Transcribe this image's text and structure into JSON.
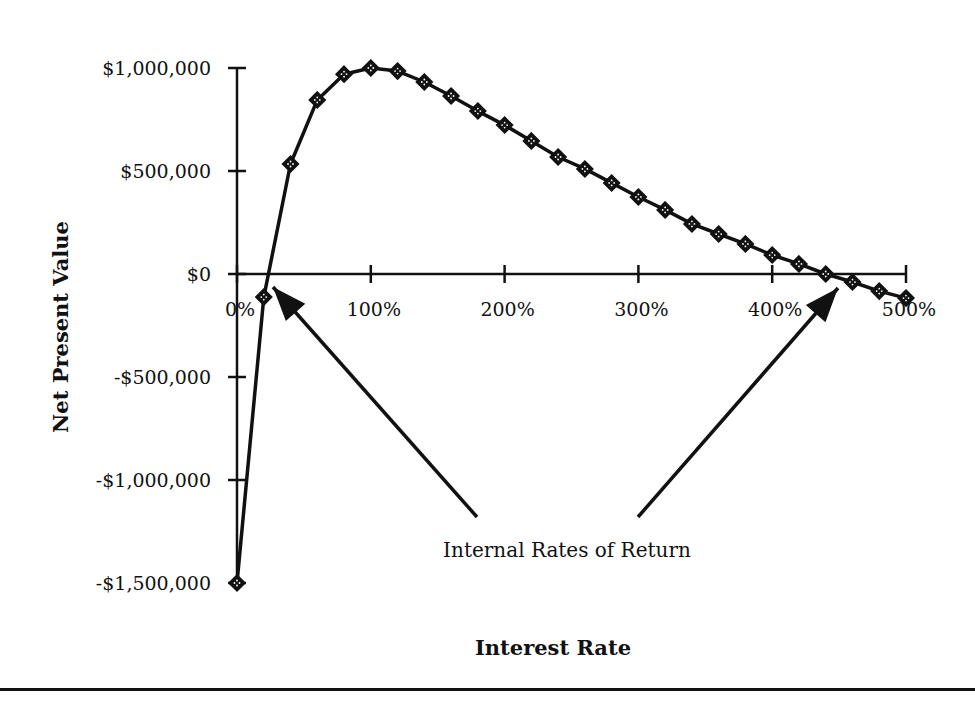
{
  "chart_data": {
    "type": "line",
    "title": "",
    "xlabel": "Interest Rate",
    "ylabel": "Net Present Value",
    "xlim": [
      0,
      500
    ],
    "ylim": [
      -1500000,
      1000000
    ],
    "x_ticks": [
      0,
      100,
      200,
      300,
      400,
      500
    ],
    "x_tick_labels": [
      "0%",
      "100%",
      "200%",
      "300%",
      "400%",
      "500%"
    ],
    "y_ticks": [
      1000000,
      500000,
      0,
      -500000,
      -1000000,
      -1500000
    ],
    "y_tick_labels": [
      "$1,000,000",
      "$500,000",
      "$0",
      "-$500,000",
      "-$1,000,000",
      "-$1,500,000"
    ],
    "grid": false,
    "legend": null,
    "marker": "diamond",
    "series": [
      {
        "name": "NPV",
        "x": [
          0,
          20,
          40,
          60,
          80,
          100,
          120,
          140,
          160,
          180,
          200,
          220,
          240,
          260,
          280,
          300,
          320,
          340,
          360,
          380,
          400,
          420,
          440,
          460,
          480,
          500
        ],
        "values": [
          -1500000,
          -112000,
          534000,
          845000,
          970000,
          1000000,
          985000,
          932000,
          864000,
          791000,
          723000,
          646000,
          568000,
          510000,
          442000,
          374000,
          311000,
          243000,
          194000,
          146000,
          92000,
          49000,
          0,
          -39000,
          -83000,
          -117000
        ]
      }
    ],
    "annotations": [
      {
        "text": "Internal Rates of Return",
        "arrows_to": [
          {
            "label": "IRR 1",
            "x_approx": 19
          },
          {
            "label": "IRR 2",
            "x_approx": 440
          }
        ]
      }
    ]
  }
}
